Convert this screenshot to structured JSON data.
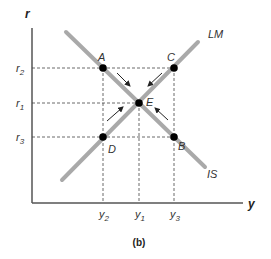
{
  "figure": {
    "caption": "(b)",
    "axes": {
      "y_label": "r",
      "x_label": "y"
    },
    "y_ticks": [
      {
        "label": "r",
        "sub": "2",
        "y": 68
      },
      {
        "label": "r",
        "sub": "1",
        "y": 103
      },
      {
        "label": "r",
        "sub": "3",
        "y": 137
      }
    ],
    "x_ticks": [
      {
        "label": "y",
        "sub": "2",
        "x": 103
      },
      {
        "label": "y",
        "sub": "1",
        "x": 139
      },
      {
        "label": "y",
        "sub": "3",
        "x": 174
      }
    ],
    "curves": [
      {
        "name": "IS",
        "label": "IS"
      },
      {
        "name": "LM",
        "label": "LM"
      }
    ],
    "points": [
      {
        "name": "A",
        "label": "A"
      },
      {
        "name": "B",
        "label": "B"
      },
      {
        "name": "C",
        "label": "C"
      },
      {
        "name": "D",
        "label": "D"
      },
      {
        "name": "E",
        "label": "E"
      }
    ],
    "colors": {
      "curve": "#a9a9a9",
      "axis": "#555555",
      "point": "#000000",
      "guide": "#333333"
    }
  }
}
